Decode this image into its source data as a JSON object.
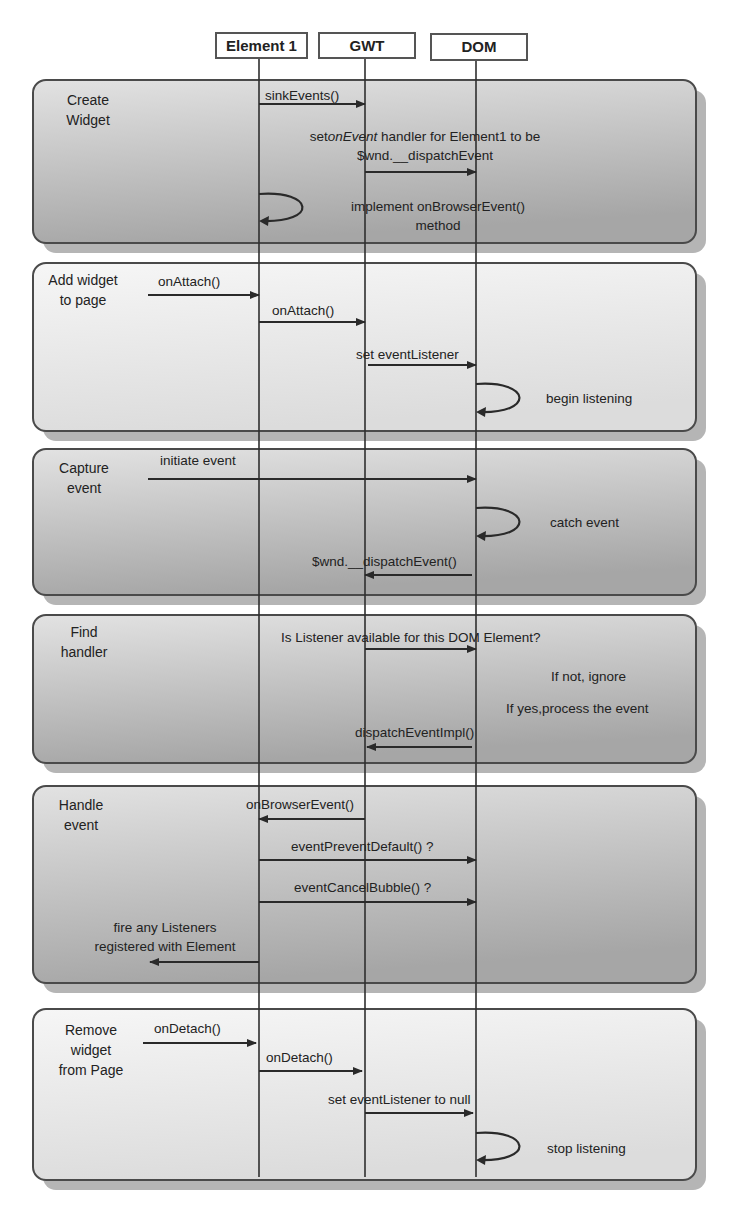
{
  "actors": [
    {
      "id": "element1",
      "label": "Element 1",
      "box": {
        "x": 215,
        "y": 32,
        "w": 93,
        "h": 27
      },
      "lifeline_x": 259
    },
    {
      "id": "gwt",
      "label": "GWT",
      "box": {
        "x": 318,
        "y": 32,
        "w": 98,
        "h": 27
      },
      "lifeline_x": 365
    },
    {
      "id": "dom",
      "label": "DOM",
      "box": {
        "x": 430,
        "y": 33,
        "w": 98,
        "h": 28
      },
      "lifeline_x": 476
    }
  ],
  "lifeline_range": {
    "top": 59,
    "bottom": 1177
  },
  "colors": {
    "panel_dark_top": "#e2e2e2",
    "panel_dark_bottom": "#a6a6a6",
    "panel_light_top": "#f6f6f6",
    "panel_light_bottom": "#dcdcdc",
    "line": "#2a2a2a",
    "shadow": "#b5b5b5"
  },
  "panels": [
    {
      "id": "create-widget",
      "title": "Create\nWidget",
      "title_lines": [
        "Create",
        "Widget"
      ],
      "style": "dark",
      "x": 33,
      "y": 80,
      "w": 663,
      "h": 163,
      "title_pos": {
        "x": 48,
        "y": 90,
        "w": 80
      },
      "messages": [
        {
          "type": "arrow",
          "from_x": 259,
          "to_x": 365,
          "y": 104,
          "label": "sinkEvents()",
          "label_x": 265,
          "label_y": 86
        },
        {
          "type": "arrow",
          "from_x": 365,
          "to_x": 476,
          "y": 172,
          "label_parts": [
            "set",
            "onEvent",
            " handler for Element1 to be"
          ],
          "label_line2": "$wnd.__dispatchEvent",
          "label_x": 280,
          "label_y": 127,
          "label_w": 290
        },
        {
          "type": "self",
          "x": 259,
          "y1": 194,
          "y2": 221,
          "label": "implement onBrowserEvent()",
          "label_line2": "method",
          "label_x": 318,
          "label_y": 197,
          "label_w": 240
        }
      ]
    },
    {
      "id": "add-widget",
      "title_lines": [
        "Add widget",
        "to page"
      ],
      "style": "light",
      "x": 33,
      "y": 263,
      "w": 663,
      "h": 168,
      "title_pos": {
        "x": 38,
        "y": 270,
        "w": 90
      },
      "messages": [
        {
          "type": "arrow",
          "from_x": 148,
          "to_x": 259,
          "y": 295,
          "label": "onAttach()",
          "label_x": 158,
          "label_y": 272
        },
        {
          "type": "arrow",
          "from_x": 259,
          "to_x": 365,
          "y": 322,
          "label": "onAttach()",
          "label_x": 272,
          "label_y": 301
        },
        {
          "type": "arrow",
          "from_x": 368,
          "to_x": 476,
          "y": 365,
          "label": "set eventListener",
          "label_x": 356,
          "label_y": 345
        },
        {
          "type": "self",
          "x": 476,
          "y1": 384,
          "y2": 412,
          "label": "begin listening",
          "label_x": 546,
          "label_y": 389
        }
      ]
    },
    {
      "id": "capture-event",
      "title_lines": [
        "Capture",
        "event"
      ],
      "style": "dark",
      "x": 33,
      "y": 449,
      "w": 663,
      "h": 146,
      "title_pos": {
        "x": 48,
        "y": 458,
        "w": 72
      },
      "messages": [
        {
          "type": "arrow",
          "from_x": 148,
          "to_x": 476,
          "y": 479,
          "label": "initiate event",
          "label_x": 160,
          "label_y": 451
        },
        {
          "type": "self",
          "x": 476,
          "y1": 508,
          "y2": 536,
          "label": "catch event",
          "label_x": 550,
          "label_y": 513
        },
        {
          "type": "arrow",
          "from_x": 472,
          "to_x": 365,
          "y": 575,
          "label": "$wnd.__dispatchEvent()",
          "label_x": 312,
          "label_y": 552
        }
      ]
    },
    {
      "id": "find-handler",
      "title_lines": [
        "Find",
        "handler"
      ],
      "style": "dark",
      "x": 33,
      "y": 615,
      "w": 663,
      "h": 148,
      "title_pos": {
        "x": 50,
        "y": 622,
        "w": 68
      },
      "messages": [
        {
          "type": "arrow",
          "from_x": 365,
          "to_x": 476,
          "y": 649,
          "label": "Is Listener available for this DOM Element?",
          "label_x": 281,
          "label_y": 628
        },
        {
          "type": "note",
          "label": "If not, ignore",
          "label_x": 551,
          "label_y": 667
        },
        {
          "type": "note",
          "label": "If yes,process the event",
          "label_x": 506,
          "label_y": 699
        },
        {
          "type": "arrow",
          "from_x": 472,
          "to_x": 367,
          "y": 747,
          "label": "dispatchEventImpl()",
          "label_x": 355,
          "label_y": 723
        }
      ]
    },
    {
      "id": "handle-event",
      "title_lines": [
        "Handle",
        "event"
      ],
      "style": "dark",
      "x": 33,
      "y": 786,
      "w": 663,
      "h": 197,
      "title_pos": {
        "x": 48,
        "y": 795,
        "w": 66
      },
      "messages": [
        {
          "type": "arrow",
          "from_x": 365,
          "to_x": 259,
          "y": 819,
          "label": "onBrowserEvent()",
          "label_x": 246,
          "label_y": 795
        },
        {
          "type": "arrow",
          "from_x": 259,
          "to_x": 476,
          "y": 860,
          "label": "eventPreventDefault() ?",
          "label_x": 291,
          "label_y": 837
        },
        {
          "type": "arrow",
          "from_x": 259,
          "to_x": 476,
          "y": 902,
          "label": "eventCancelBubble() ?",
          "label_x": 294,
          "label_y": 878
        },
        {
          "type": "arrow",
          "from_x": 259,
          "to_x": 150,
          "y": 962,
          "label": "fire any Listeners",
          "label_line2": "registered with Element",
          "label_x": 70,
          "label_y": 918,
          "label_w": 190
        }
      ]
    },
    {
      "id": "remove-widget",
      "title_lines": [
        "Remove",
        "widget",
        "from Page"
      ],
      "style": "light",
      "x": 33,
      "y": 1009,
      "w": 663,
      "h": 171,
      "title_pos": {
        "x": 50,
        "y": 1020,
        "w": 82
      },
      "messages": [
        {
          "type": "arrow",
          "from_x": 143,
          "to_x": 256,
          "y": 1043,
          "label": "onDetach()",
          "label_x": 154,
          "label_y": 1019
        },
        {
          "type": "arrow",
          "from_x": 259,
          "to_x": 362,
          "y": 1071,
          "label": "onDetach()",
          "label_x": 266,
          "label_y": 1048
        },
        {
          "type": "arrow",
          "from_x": 365,
          "to_x": 473,
          "y": 1113,
          "label": "set eventListener to null",
          "label_x": 328,
          "label_y": 1090
        },
        {
          "type": "self",
          "x": 476,
          "y1": 1133,
          "y2": 1160,
          "label": "stop listening",
          "label_x": 547,
          "label_y": 1139
        }
      ]
    }
  ]
}
